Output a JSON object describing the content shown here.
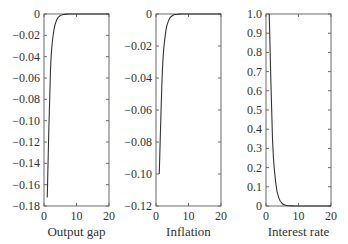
{
  "chart_data": [
    {
      "type": "line",
      "title": "",
      "xlabel": "Output gap",
      "ylabel": "",
      "xlim": [
        0,
        20
      ],
      "ylim": [
        -0.18,
        0
      ],
      "xticks": [
        0,
        10,
        20
      ],
      "yticks": [
        0,
        -0.02,
        -0.04,
        -0.06,
        -0.08,
        -0.1,
        -0.12,
        -0.14,
        -0.16,
        -0.18
      ],
      "ytick_labels": [
        "0",
        "−0.02",
        "−0.04",
        "−0.06",
        "−0.08",
        "−0.10",
        "−0.12",
        "−0.14",
        "−0.16",
        "−0.18"
      ],
      "grid": false,
      "series": [
        {
          "name": "Output gap",
          "x": [
            1,
            2,
            3,
            4,
            5,
            6,
            7,
            8,
            9,
            10
          ],
          "values": [
            -0.172,
            -0.052,
            -0.016,
            -0.005,
            -0.0015,
            -0.0005,
            -0.0001,
            0,
            0,
            0
          ]
        }
      ]
    },
    {
      "type": "line",
      "title": "",
      "xlabel": "Inflation",
      "ylabel": "",
      "xlim": [
        0,
        20
      ],
      "ylim": [
        -0.12,
        0
      ],
      "xticks": [
        0,
        10,
        20
      ],
      "yticks": [
        0,
        -0.02,
        -0.04,
        -0.06,
        -0.08,
        -0.1,
        -0.12
      ],
      "ytick_labels": [
        "0",
        "−0.02",
        "−0.04",
        "−0.06",
        "−0.08",
        "−0.10",
        "−0.12"
      ],
      "grid": false,
      "series": [
        {
          "name": "Inflation",
          "x": [
            1,
            2,
            3,
            4,
            5,
            6,
            7,
            8,
            9,
            10
          ],
          "values": [
            -0.1,
            -0.034,
            -0.011,
            -0.0035,
            -0.0011,
            -0.0003,
            -0.0001,
            0,
            0,
            0
          ]
        }
      ]
    },
    {
      "type": "line",
      "title": "",
      "xlabel": "Interest rate",
      "ylabel": "",
      "xlim": [
        0,
        20
      ],
      "ylim": [
        0,
        1.0
      ],
      "xticks": [
        0,
        10,
        20
      ],
      "yticks": [
        1.0,
        0.9,
        0.8,
        0.7,
        0.6,
        0.5,
        0.4,
        0.3,
        0.2,
        0.1,
        0
      ],
      "ytick_labels": [
        "1.0",
        "0.9",
        "0.8",
        "0.7",
        "0.6",
        "0.5",
        "0.4",
        "0.3",
        "0.2",
        "0.1",
        "0"
      ],
      "grid": false,
      "series": [
        {
          "name": "Interest rate",
          "x": [
            1,
            2,
            3,
            4,
            5,
            6,
            7,
            8,
            9,
            10
          ],
          "values": [
            1.0,
            0.35,
            0.12,
            0.04,
            0.013,
            0.004,
            0.0013,
            0.0004,
            0,
            0
          ]
        }
      ]
    }
  ]
}
